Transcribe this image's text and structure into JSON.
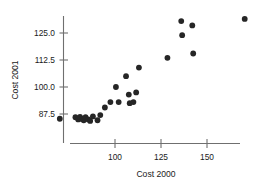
{
  "chart_data": {
    "type": "scatter",
    "title": "",
    "xlabel": "Cost 2000",
    "ylabel": "Cost 2001",
    "xlim": [
      66,
      183
    ],
    "ylim": [
      81.5,
      133.5
    ],
    "xticks": [
      100,
      125,
      150
    ],
    "xtick_labels": [
      "100",
      "125",
      "150"
    ],
    "yticks": [
      87.5,
      100.0,
      112.5,
      125.0
    ],
    "ytick_labels": [
      "87.5",
      "100.0",
      "112.5",
      "125.0"
    ],
    "grid": false,
    "legend": null,
    "marker_color": "#262626",
    "axis_color": "#6f6f6f",
    "series": [
      {
        "name": "Cost 2001 vs Cost 2000",
        "points": [
          [
            70.0,
            85.3
          ],
          [
            78.5,
            86.0
          ],
          [
            80.0,
            85.0
          ],
          [
            81.0,
            86.2
          ],
          [
            82.0,
            85.2
          ],
          [
            83.0,
            84.6
          ],
          [
            84.0,
            86.0
          ],
          [
            85.5,
            85.0
          ],
          [
            86.5,
            84.3
          ],
          [
            88.0,
            86.4
          ],
          [
            90.5,
            84.6
          ],
          [
            92.0,
            87.0
          ],
          [
            94.5,
            90.5
          ],
          [
            97.5,
            93.0
          ],
          [
            100.5,
            100.0
          ],
          [
            102.0,
            93.0
          ],
          [
            106.0,
            105.0
          ],
          [
            107.5,
            96.5
          ],
          [
            108.0,
            92.5
          ],
          [
            110.0,
            93.0
          ],
          [
            111.5,
            97.5
          ],
          [
            113.0,
            109.0
          ],
          [
            128.5,
            113.5
          ],
          [
            136.5,
            124.0
          ],
          [
            136.0,
            130.5
          ],
          [
            142.0,
            128.5
          ],
          [
            142.5,
            115.5
          ],
          [
            170.5,
            131.5
          ]
        ]
      }
    ]
  },
  "figure": {
    "background": "#ffffff"
  }
}
